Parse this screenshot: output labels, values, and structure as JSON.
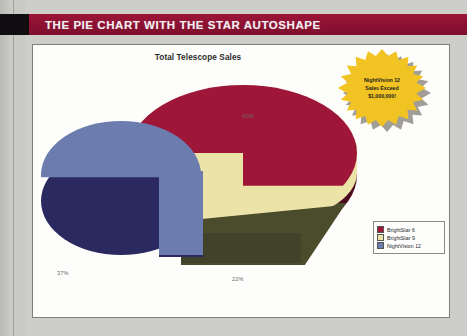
{
  "banner": {
    "title": "THE PIE CHART WITH THE STAR AUTOSHAPE",
    "bar_color": "#8e1133",
    "tab_color": "#100e10"
  },
  "chart_frame": {
    "border_color": "#7d7e7a",
    "background": "#fdfdfb"
  },
  "callout": {
    "shape": "star-autoshape",
    "fill_color": "#f2c423",
    "line1": "NightVision 12",
    "line2": "Sales Exceed",
    "line3": "$1,000,000!"
  },
  "legend": {
    "position": "right",
    "items": [
      {
        "label": "BrightStar 6",
        "color": "#9e1739"
      },
      {
        "label": "BrightStar 9",
        "color": "#ece3a8"
      },
      {
        "label": "NightVision 12",
        "color": "#6d7cae"
      }
    ]
  },
  "chart_data": {
    "type": "pie",
    "title": "Total Telescope Sales",
    "xlabel": "",
    "ylabel": "",
    "three_d": true,
    "exploded_slice": "NightVision 12",
    "labels": [
      "BrightStar 6",
      "BrightStar 9",
      "NightVision 12"
    ],
    "categories": [
      "BrightStar 6",
      "BrightStar 9",
      "NightVision 12"
    ],
    "values": [
      41,
      22,
      37
    ],
    "data_labels": [
      "41%",
      "22%",
      "37%"
    ],
    "colors": [
      "#9e1739",
      "#ece3a8",
      "#6d7cae"
    ],
    "legend_position": "right",
    "grid": false
  }
}
